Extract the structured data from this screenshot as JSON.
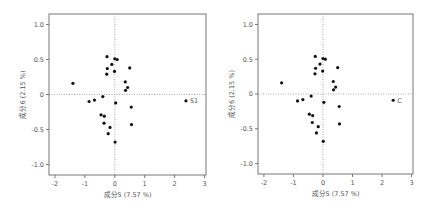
{
  "chart_data": [
    {
      "type": "scatter",
      "title": "",
      "xlabel": "成分5 (7.57 %)",
      "ylabel": "成分6 (2.15 %)",
      "xlim": [
        -2.2,
        3.05
      ],
      "ylim": [
        -1.15,
        1.15
      ],
      "xticks": [
        -2,
        -1,
        0,
        1,
        2,
        3
      ],
      "yticks": [
        1.0,
        0.5,
        0,
        -0.5,
        -1.0
      ],
      "ytick_labels": [
        "1.0",
        "0.5",
        "0",
        "-0.5",
        "-1.0"
      ],
      "grid": false,
      "reference_lines": {
        "x": 0,
        "y": 0,
        "style": "dotted"
      },
      "annotations": [
        {
          "text": "S1",
          "x": 2.38,
          "y": -0.09
        }
      ],
      "points": [
        {
          "x": -0.26,
          "y": 0.54
        },
        {
          "x": 0.0,
          "y": 0.51
        },
        {
          "x": 0.08,
          "y": 0.5
        },
        {
          "x": -0.1,
          "y": 0.43
        },
        {
          "x": -0.25,
          "y": 0.37
        },
        {
          "x": -0.01,
          "y": 0.33
        },
        {
          "x": -0.27,
          "y": 0.29
        },
        {
          "x": 0.5,
          "y": 0.38
        },
        {
          "x": 0.35,
          "y": 0.18
        },
        {
          "x": 0.43,
          "y": 0.1
        },
        {
          "x": 0.36,
          "y": 0.06
        },
        {
          "x": -1.4,
          "y": 0.16
        },
        {
          "x": -0.4,
          "y": -0.03
        },
        {
          "x": -0.68,
          "y": -0.08
        },
        {
          "x": -0.86,
          "y": -0.1
        },
        {
          "x": 0.03,
          "y": -0.12
        },
        {
          "x": 2.38,
          "y": -0.09
        },
        {
          "x": 0.55,
          "y": -0.18
        },
        {
          "x": -0.46,
          "y": -0.29
        },
        {
          "x": -0.35,
          "y": -0.31
        },
        {
          "x": -0.36,
          "y": -0.41
        },
        {
          "x": -0.16,
          "y": -0.47
        },
        {
          "x": -0.22,
          "y": -0.56
        },
        {
          "x": 0.56,
          "y": -0.43
        },
        {
          "x": 0.01,
          "y": -0.68
        }
      ]
    },
    {
      "type": "scatter",
      "title": "",
      "xlabel": "成分5 (7.57 %)",
      "ylabel": "成分6 (2.15 %)",
      "xlim": [
        -2.2,
        3.05
      ],
      "ylim": [
        -1.15,
        1.15
      ],
      "xticks": [
        -2,
        -1,
        0,
        1,
        2,
        3
      ],
      "yticks": [
        1.0,
        0.5,
        0,
        -0.5,
        -1.0
      ],
      "ytick_labels": [
        "1.0",
        "0.5",
        "0",
        "-0.5",
        "-1.0"
      ],
      "grid": false,
      "reference_lines": {
        "x": 0,
        "y": 0,
        "style": "dotted"
      },
      "annotations": [
        {
          "text": "C",
          "x": 2.38,
          "y": -0.09
        }
      ],
      "points": [
        {
          "x": -0.26,
          "y": 0.54
        },
        {
          "x": 0.0,
          "y": 0.51
        },
        {
          "x": 0.08,
          "y": 0.5
        },
        {
          "x": -0.1,
          "y": 0.43
        },
        {
          "x": -0.25,
          "y": 0.37
        },
        {
          "x": -0.01,
          "y": 0.33
        },
        {
          "x": -0.27,
          "y": 0.29
        },
        {
          "x": 0.5,
          "y": 0.38
        },
        {
          "x": 0.35,
          "y": 0.18
        },
        {
          "x": 0.43,
          "y": 0.1
        },
        {
          "x": 0.36,
          "y": 0.06
        },
        {
          "x": -1.4,
          "y": 0.16
        },
        {
          "x": -0.4,
          "y": -0.03
        },
        {
          "x": -0.68,
          "y": -0.08
        },
        {
          "x": -0.86,
          "y": -0.1
        },
        {
          "x": 0.03,
          "y": -0.12
        },
        {
          "x": 2.38,
          "y": -0.09
        },
        {
          "x": 0.55,
          "y": -0.18
        },
        {
          "x": -0.46,
          "y": -0.29
        },
        {
          "x": -0.35,
          "y": -0.31
        },
        {
          "x": -0.36,
          "y": -0.41
        },
        {
          "x": -0.16,
          "y": -0.47
        },
        {
          "x": -0.22,
          "y": -0.56
        },
        {
          "x": 0.56,
          "y": -0.43
        },
        {
          "x": 0.01,
          "y": -0.68
        }
      ]
    }
  ],
  "colors": {
    "frame": "#777777",
    "refline": "#aaaaaa",
    "point": "#111111",
    "text": "#555555"
  }
}
